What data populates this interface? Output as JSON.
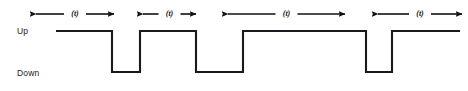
{
  "figure": {
    "title": "",
    "width": 468,
    "height": 91,
    "background": "#ffffff",
    "stroke_color": "#1a1a1a"
  },
  "axis_labels": {
    "up": "Up",
    "down": "Down"
  },
  "chart_data": {
    "type": "line",
    "title": "",
    "xlabel": "",
    "ylabel": "",
    "levels": {
      "up_label": "Up",
      "down_label": "Down",
      "up_y_px": 31,
      "down_y_px": 72
    },
    "signal_name": "square-wave-timing-signal",
    "x_start_px": 56,
    "x_end_px": 460,
    "transitions_px": [
      {
        "x": 56,
        "level": "up",
        "edge": "start"
      },
      {
        "x": 112,
        "level": "down",
        "edge": "falling"
      },
      {
        "x": 140,
        "level": "up",
        "edge": "rising"
      },
      {
        "x": 196,
        "level": "down",
        "edge": "falling"
      },
      {
        "x": 243,
        "level": "up",
        "edge": "rising"
      },
      {
        "x": 366,
        "level": "down",
        "edge": "falling"
      },
      {
        "x": 392,
        "level": "up",
        "edge": "rising"
      },
      {
        "x": 460,
        "level": "up",
        "edge": "end"
      }
    ],
    "segments": [
      {
        "level": "up",
        "x0": 56,
        "x1": 112
      },
      {
        "level": "down",
        "x0": 112,
        "x1": 140
      },
      {
        "level": "up",
        "x0": 140,
        "x1": 196
      },
      {
        "level": "down",
        "x0": 196,
        "x1": 243
      },
      {
        "level": "up",
        "x0": 243,
        "x1": 366
      },
      {
        "level": "down",
        "x0": 366,
        "x1": 392
      },
      {
        "level": "up",
        "x0": 392,
        "x1": 460
      }
    ]
  },
  "intervals": [
    {
      "label": "(t)",
      "x_left": 36,
      "x_right": 114,
      "y": 14,
      "measures": "up-duration-1"
    },
    {
      "label": "(t)",
      "x_left": 143,
      "x_right": 196,
      "y": 14,
      "measures": "up-duration-2"
    },
    {
      "label": "(t)",
      "x_left": 228,
      "x_right": 345,
      "y": 14,
      "measures": "up-duration-3"
    },
    {
      "label": "(t)",
      "x_left": 378,
      "x_right": 462,
      "y": 14,
      "measures": "up-duration-4"
    }
  ]
}
